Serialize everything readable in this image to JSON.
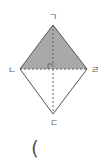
{
  "diagram": {
    "shape": "rhombus",
    "shaded_region": "triangle ㄱㄴㄹ",
    "colors": {
      "fill": "#a9a9a9",
      "stroke": "#555555",
      "diagonal": "#666666",
      "label": "#555555"
    },
    "vertices": [
      {
        "id": "top",
        "label": "ㄱ",
        "x": 53,
        "y": 25,
        "label_x": 53,
        "label_y": 20
      },
      {
        "id": "left",
        "label": "ㄴ",
        "x": 20,
        "y": 69,
        "label_x": 12,
        "label_y": 73
      },
      {
        "id": "bottom",
        "label": "ㄷ",
        "x": 53,
        "y": 114,
        "label_x": 54,
        "label_y": 126
      },
      {
        "id": "right",
        "label": "ㄹ",
        "x": 87,
        "y": 69,
        "label_x": 95,
        "label_y": 73
      }
    ],
    "right_angle_marker": true
  },
  "answer_blank": {
    "text": "("
  }
}
